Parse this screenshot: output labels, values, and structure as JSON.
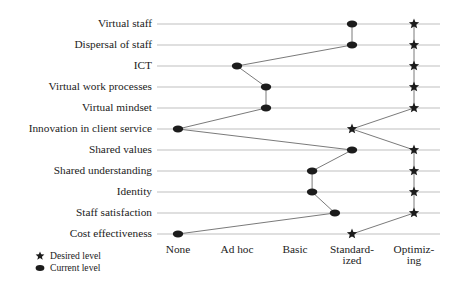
{
  "chart_data": {
    "type": "scatter",
    "title": "",
    "subtitle": "",
    "xlabel": "",
    "ylabel": "",
    "grid": true,
    "legend_position": "bottom-left",
    "x_tick_labels": [
      "None",
      "Ad hoc",
      "Basic",
      "Standard-ized",
      "Optimiz-ing"
    ],
    "x_tick_labels_wrapped": [
      [
        "None"
      ],
      [
        "Ad hoc"
      ],
      [
        "Basic"
      ],
      [
        "Standard-",
        "ized"
      ],
      [
        "Optimiz-",
        "ing"
      ]
    ],
    "x_scale_values": [
      1,
      2,
      3,
      4,
      5
    ],
    "xlim": [
      0.65,
      5.45
    ],
    "categories": [
      "Virtual staff",
      "Dispersal of staff",
      "ICT",
      "Virtual work processes",
      "Virtual mindset",
      "Innovation in client service",
      "Shared values",
      "Shared understanding",
      "Identity",
      "Staff satisfaction",
      "Cost effectiveness"
    ],
    "series": [
      {
        "name": "Current level",
        "marker": "ellipse",
        "color": "#1c1c1c",
        "values": [
          4,
          4,
          2,
          2.5,
          2.5,
          1,
          4,
          3.3,
          3.3,
          3.7,
          1
        ]
      },
      {
        "name": "Desired level",
        "marker": "star",
        "color": "#1c1c1c",
        "values": [
          5,
          5,
          5,
          5,
          5,
          4,
          5,
          5,
          5,
          5,
          4
        ]
      }
    ]
  },
  "legend": {
    "entries": [
      {
        "label": "Desired level",
        "marker": "star-icon"
      },
      {
        "label": "Current level",
        "marker": "dot-icon"
      }
    ]
  }
}
